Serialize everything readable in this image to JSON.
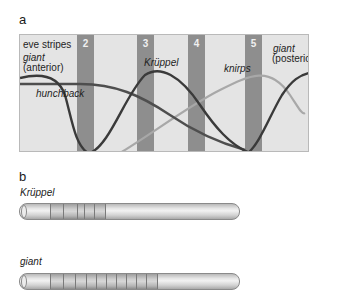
{
  "panel_a": {
    "label": "a",
    "legend_label": "eve stripes",
    "stripes": [
      {
        "number": "2",
        "x": 57
      },
      {
        "number": "3",
        "x": 117
      },
      {
        "number": "4",
        "x": 168
      },
      {
        "number": "5",
        "x": 225
      }
    ],
    "gene_labels": {
      "giant_anterior_name": "giant",
      "giant_anterior_qualifier": "(anterior)",
      "hunchback": "hunchback",
      "kruppel": "Krüppel",
      "knirps": "knirps",
      "giant_posterior_name": "giant",
      "giant_posterior_qualifier": "(posterior)"
    },
    "colors": {
      "background": "#e4e4e4",
      "stripe": "#8e8e8e",
      "dark_curve": "#3a3a3a",
      "medium_curve": "#4e4e4e",
      "light_curve": "#a8a8a8"
    }
  },
  "panel_b": {
    "label": "b",
    "tubes": [
      {
        "gene": "Krüppel",
        "band_start": 46,
        "band_width": 40,
        "band_lines": [
          58,
          68,
          75
        ]
      },
      {
        "gene": "giant",
        "band_start": 46,
        "band_width": 90,
        "band_lines": [
          58,
          68,
          78,
          90,
          100,
          110,
          120,
          130
        ]
      }
    ]
  }
}
